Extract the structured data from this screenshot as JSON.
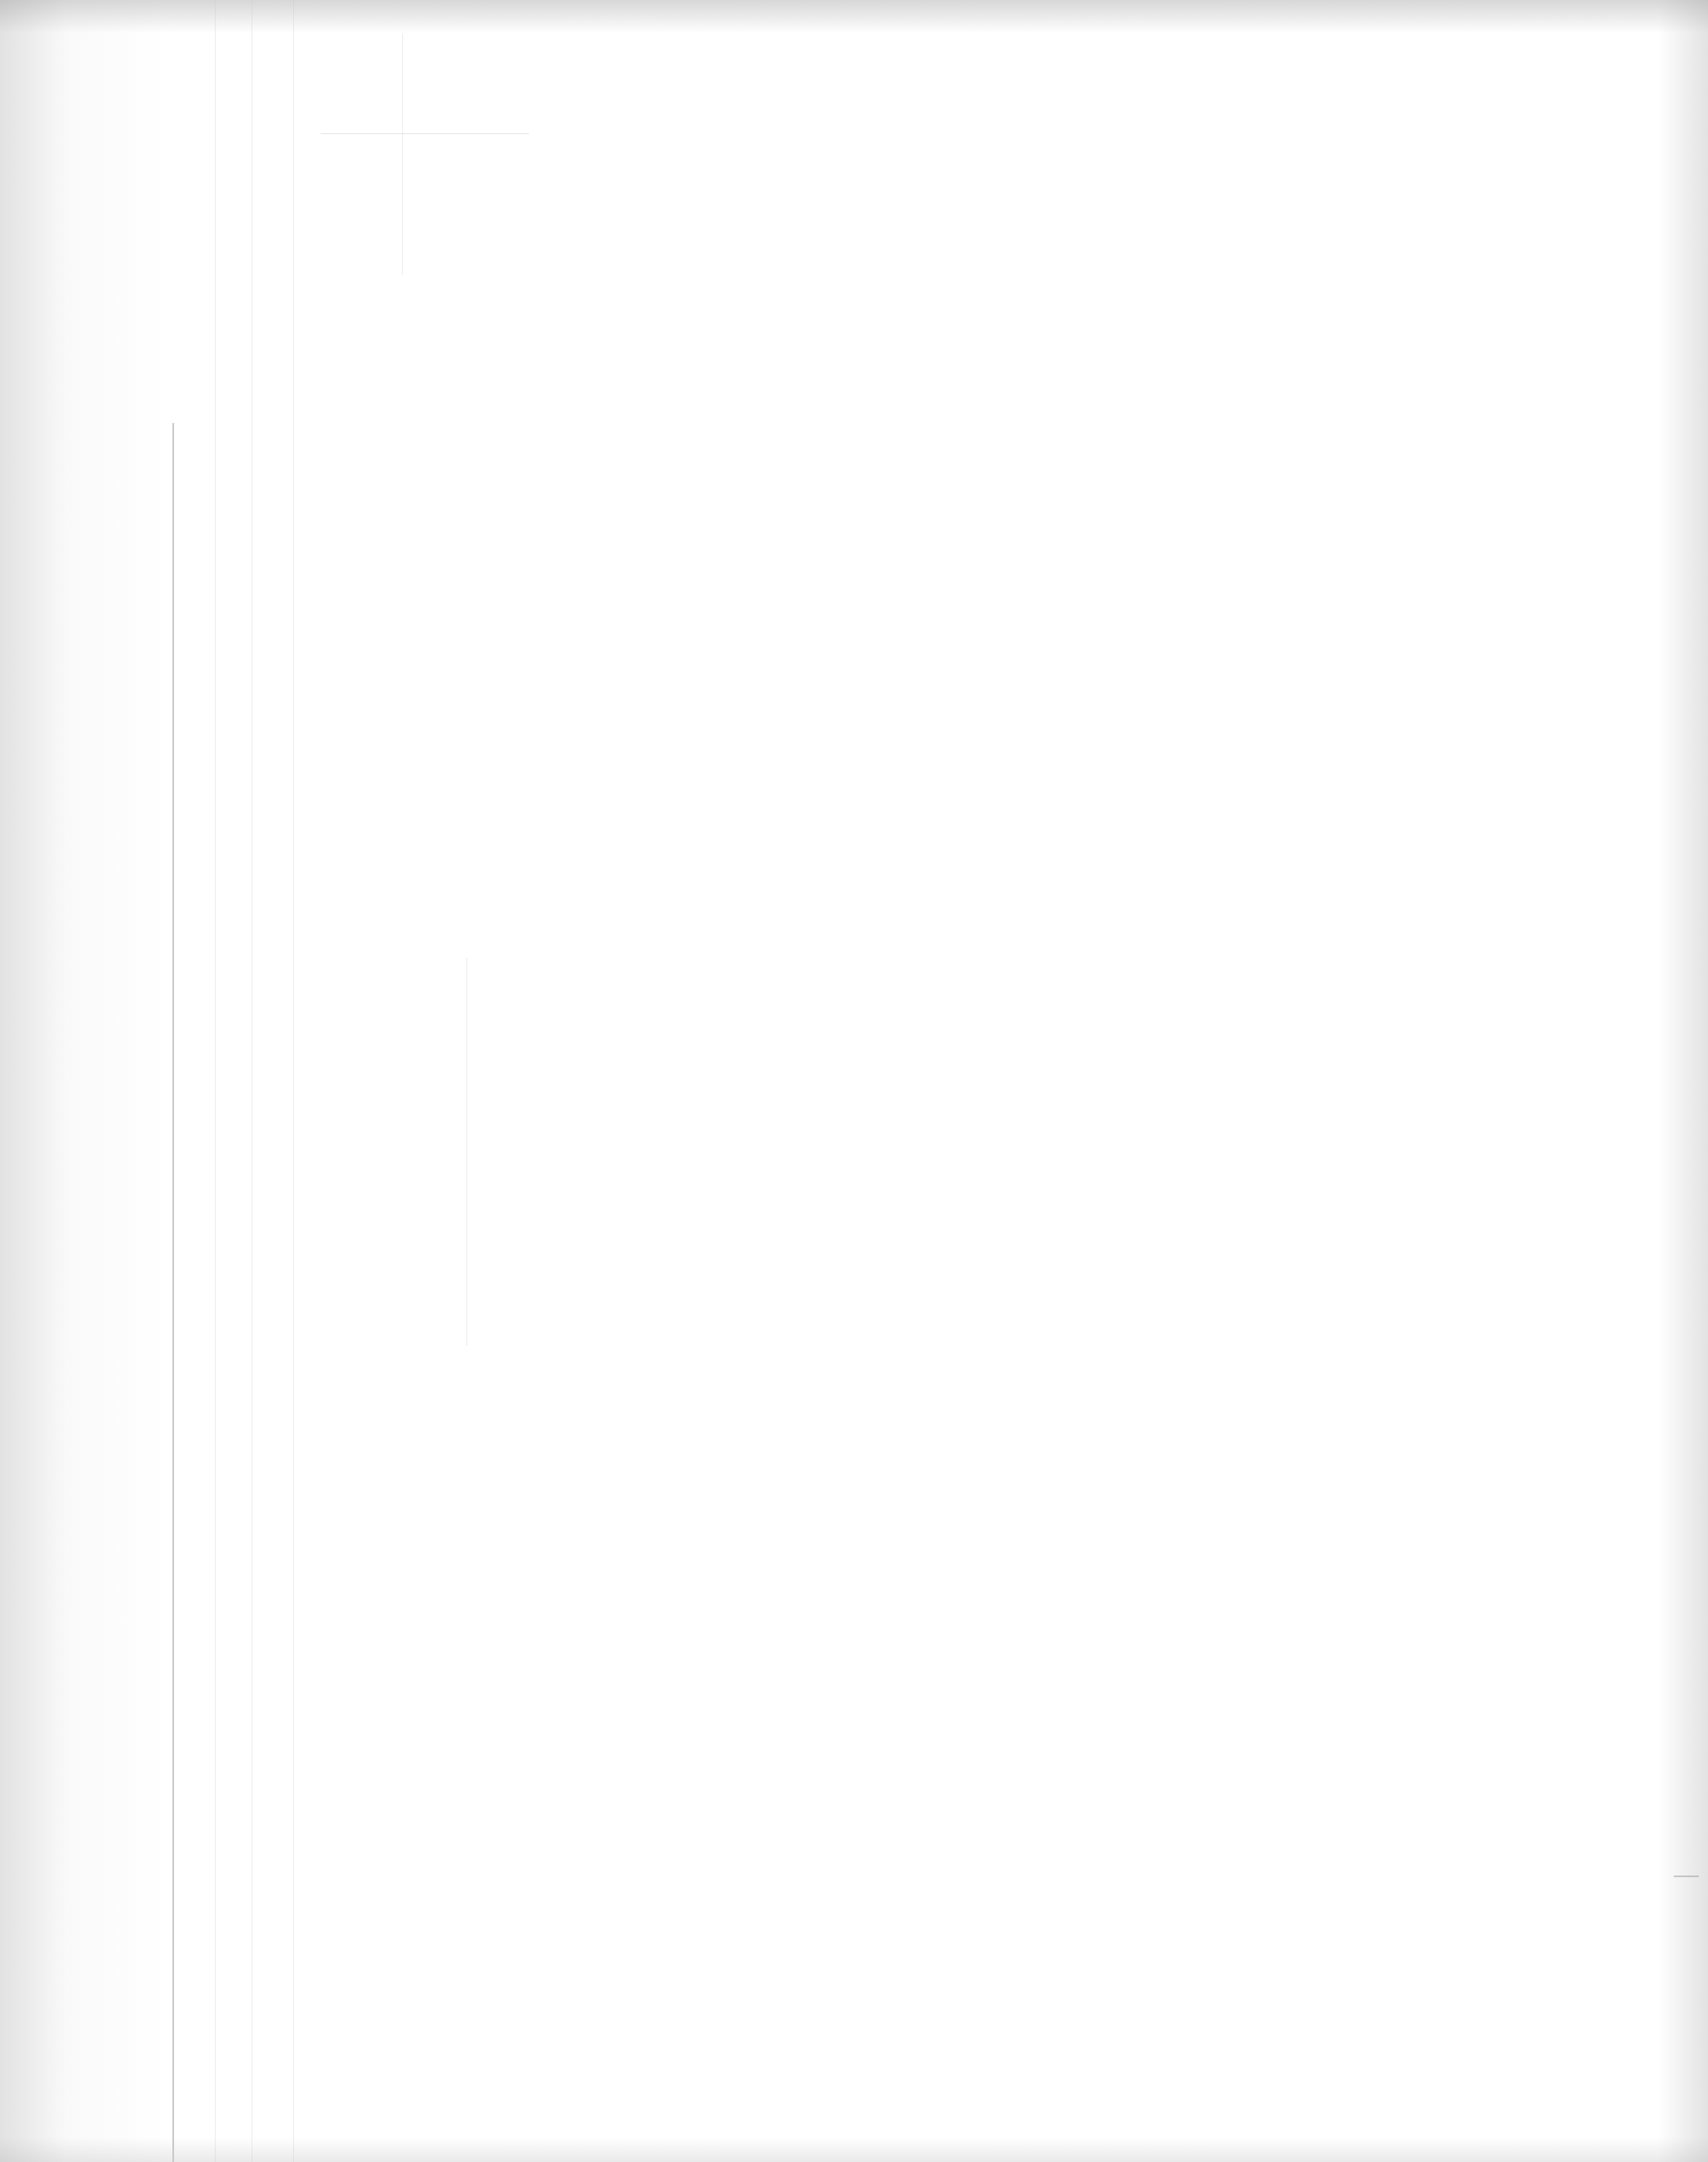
{
  "page": {
    "type": "blank-scanned-page",
    "width": 2051,
    "height": 2596,
    "background_color": "#ffffff",
    "edge_shading_color": "#969696",
    "margin_rule_color": "#c9c9c9",
    "text_content": ""
  }
}
